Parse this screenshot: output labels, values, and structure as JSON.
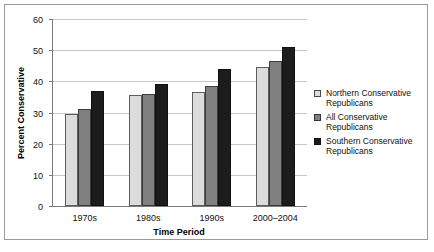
{
  "chart_data": {
    "type": "bar",
    "title": "",
    "xlabel": "Time Period",
    "ylabel": "Percent Conservative",
    "categories": [
      "1970s",
      "1980s",
      "1990s",
      "2000–2004"
    ],
    "series": [
      {
        "name": "Northern Conservative Republicans",
        "color": "#dcdcdc",
        "values": [
          29.5,
          35.5,
          36.5,
          44.5
        ]
      },
      {
        "name": "All Conservative Republicans",
        "color": "#808080",
        "values": [
          31.0,
          36.0,
          38.5,
          46.5
        ]
      },
      {
        "name": "Southern Conservative Republicans",
        "color": "#1c1c1c",
        "values": [
          37.0,
          39.0,
          44.0,
          51.0
        ]
      }
    ],
    "ylim": [
      0,
      60
    ],
    "yticks": [
      0,
      10,
      20,
      30,
      40,
      50,
      60
    ],
    "ytick_labels": [
      "0",
      "10",
      "20",
      "30",
      "40",
      "50",
      "60"
    ],
    "grid": true,
    "legend_position": "right"
  },
  "legend": {
    "items": [
      {
        "label": "Northern Conservative Republicans"
      },
      {
        "label": "All Conservative Republicans"
      },
      {
        "label": "Southern Conservative Republicans"
      }
    ]
  }
}
